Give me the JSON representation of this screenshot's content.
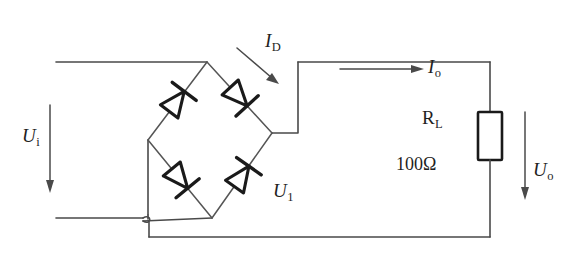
{
  "diagram": {
    "type": "schematic",
    "colors": {
      "wire": "#4a4a4a",
      "diode": "#1a1a1a",
      "background": "#ffffff"
    }
  },
  "labels": {
    "input_voltage": "U",
    "input_voltage_sub": "i",
    "diode_current": "I",
    "diode_current_sub": "D",
    "output_current": "I",
    "output_current_sub": "o",
    "bridge_voltage": "U",
    "bridge_voltage_sub": "1",
    "output_voltage": "U",
    "output_voltage_sub": "o",
    "load_resistor": "R",
    "load_resistor_sub": "L",
    "resistance_value": "100Ω"
  },
  "components": {
    "diodes": [
      {
        "name": "diode-top-left",
        "position": "top-left",
        "direction": "up-right"
      },
      {
        "name": "diode-top-right",
        "position": "top-right",
        "direction": "down-right"
      },
      {
        "name": "diode-bottom-left",
        "position": "bottom-left",
        "direction": "down-right"
      },
      {
        "name": "diode-bottom-right",
        "position": "bottom-right",
        "direction": "up-right"
      }
    ],
    "resistor": {
      "designator": "R",
      "designator_sub": "L",
      "value": "100Ω"
    }
  },
  "arrows": [
    {
      "name": "input-voltage-arrow",
      "direction": "down"
    },
    {
      "name": "diode-current-arrow",
      "direction": "down-right"
    },
    {
      "name": "output-current-arrow",
      "direction": "right"
    },
    {
      "name": "output-voltage-arrow",
      "direction": "down"
    }
  ]
}
